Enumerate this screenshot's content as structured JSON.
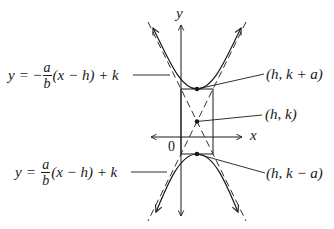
{
  "diagram": {
    "type": "hyperbola-vertical-transverse-axis",
    "axes": {
      "x_label": "x",
      "y_label": "y",
      "origin_label": "0"
    },
    "points": {
      "top_vertex": {
        "label": "(h, k + a)"
      },
      "center": {
        "label": "(h, k)"
      },
      "bottom_vertex": {
        "label": "(h, k − a)"
      }
    },
    "asymptotes": {
      "upper_label": {
        "lhs": "y",
        "eq": "=",
        "sign": "−",
        "frac_num": "a",
        "frac_den": "b",
        "rest": "(x − h) + k"
      },
      "lower_label": {
        "lhs": "y",
        "eq": "=",
        "sign": "",
        "frac_num": "a",
        "frac_den": "b",
        "rest": "(x − h) + k"
      }
    },
    "colors": {
      "ink": "#1a1a1a",
      "background": "#ffffff"
    }
  }
}
